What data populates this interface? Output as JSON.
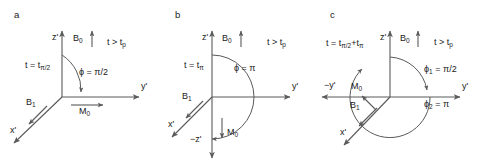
{
  "figure": {
    "type": "vector-diagram",
    "background_color": "#ffffff",
    "line_color": "#5a5a5a",
    "text_color": "#1a1a1a",
    "width": 484,
    "height": 168
  },
  "panels": [
    {
      "letter": "a",
      "axes": {
        "z": "z'",
        "y": "y'",
        "x": "x'"
      },
      "labels": {
        "b0": "B",
        "b0_sub": "0",
        "b1": "B",
        "b1_sub": "1",
        "m0": "M",
        "m0_sub": "0",
        "time_condition": "t > t",
        "time_condition_sub": "p",
        "time_value_lhs": "t = t",
        "time_value_sub": "π/2",
        "phi": "ϕ = π/2"
      }
    },
    {
      "letter": "b",
      "axes": {
        "z": "z'",
        "y": "y'",
        "x": "x'",
        "minus_z": "−z'"
      },
      "labels": {
        "b0": "B",
        "b0_sub": "0",
        "b1": "B",
        "b1_sub": "1",
        "m0": "M",
        "m0_sub": "0",
        "time_condition": "t > t",
        "time_condition_sub": "p",
        "time_value_lhs": "t = t",
        "time_value_sub": "π",
        "phi": "ϕ = π"
      }
    },
    {
      "letter": "c",
      "axes": {
        "z": "z'",
        "y": "y'",
        "x": "x'",
        "minus_y": "−y'"
      },
      "labels": {
        "b0": "B",
        "b0_sub": "0",
        "b1": "B",
        "b1_sub": "1",
        "m0": "M",
        "m0_sub": "0",
        "time_condition": "t > t",
        "time_condition_sub": "p",
        "time_value": "t = t",
        "time_value_sub1": "π/2",
        "time_value_plus": "+t",
        "time_value_sub2": "π",
        "phi1": "ϕ",
        "phi1_sub": "1",
        "phi1_eq": " = π/2",
        "phi2": "ϕ",
        "phi2_sub": "2",
        "phi2_eq": " = π"
      }
    }
  ]
}
